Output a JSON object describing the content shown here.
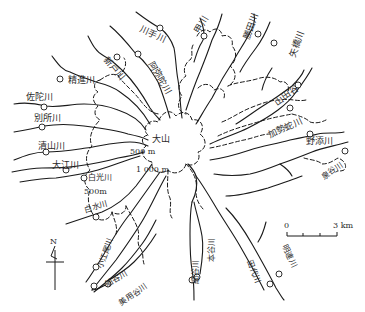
{
  "map": {
    "summit": {
      "label": "大山"
    },
    "contours": [
      {
        "label": "500 m"
      },
      {
        "label": "1 000 m"
      },
      {
        "label": "500m"
      }
    ],
    "rivers": [
      {
        "id": "kawate",
        "label": "川手川"
      },
      {
        "id": "kogawa",
        "label": "甲川"
      },
      {
        "id": "katsuta",
        "label": "勝田川"
      },
      {
        "id": "yahashi",
        "label": "矢橋川"
      },
      {
        "id": "shindo",
        "label": "新戸川"
      },
      {
        "id": "aminoda",
        "label": "阿弥陀川"
      },
      {
        "id": "seishin",
        "label": "精進川"
      },
      {
        "id": "sada",
        "label": "佐陀川"
      },
      {
        "id": "bessho",
        "label": "別所川"
      },
      {
        "id": "kiyoyama",
        "label": "清山川"
      },
      {
        "id": "oe",
        "label": "大江川"
      },
      {
        "id": "hakko",
        "label": "白光川"
      },
      {
        "id": "shiramizu",
        "label": "白水川"
      },
      {
        "id": "koeo",
        "label": "小江尾川"
      },
      {
        "id": "funatani",
        "label": "船谷川"
      },
      {
        "id": "miyotani",
        "label": "美用谷川"
      },
      {
        "id": "hosodani",
        "label": "細谷川"
      },
      {
        "id": "hondani",
        "label": "本谷川"
      },
      {
        "id": "tashiro",
        "label": "田代川"
      },
      {
        "id": "akenren",
        "label": "明連川"
      },
      {
        "id": "yamadani",
        "label": "山田谷"
      },
      {
        "id": "kaseda",
        "label": "加勢蛇川"
      },
      {
        "id": "nozoe",
        "label": "野添川"
      },
      {
        "id": "izumidani",
        "label": "泉谷川"
      }
    ],
    "scale_bar": {
      "start": "0",
      "end": "3 km"
    },
    "north_arrow": {
      "label": "N"
    }
  }
}
